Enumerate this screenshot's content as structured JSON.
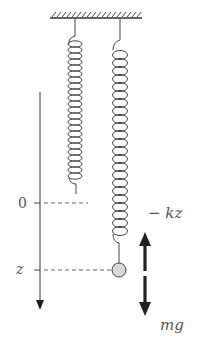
{
  "diagram": {
    "type": "mass-spring system",
    "labels": {
      "origin": "0",
      "position": "z",
      "spring_force": "− kz",
      "gravity_force": "mg"
    },
    "components": {
      "ceiling": "fixed support",
      "left_spring": "unstretched spring (natural length)",
      "right_spring": "stretched spring with mass",
      "mass": "ball",
      "axis": "downward z-axis"
    },
    "colors": {
      "line": "#333333",
      "mass_fill": "#d8d8d8",
      "arrow": "#222222",
      "text": "#555555"
    }
  }
}
